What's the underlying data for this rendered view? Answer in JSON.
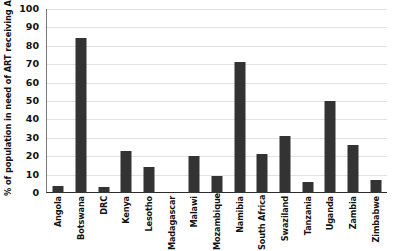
{
  "chart_data": {
    "type": "bar",
    "title": "",
    "xlabel": "",
    "ylabel": "% of population in need of ART receiving ART",
    "ylim": [
      0,
      100
    ],
    "ytick_labels": [
      "100",
      "90",
      "80",
      "70",
      "60",
      "50",
      "40",
      "30",
      "20",
      "10",
      "0"
    ],
    "yticks": [
      100,
      90,
      80,
      70,
      60,
      50,
      40,
      30,
      20,
      10,
      0
    ],
    "grid": true,
    "legend": false,
    "bar_color": "#333333",
    "categories": [
      "Angola",
      "Botswana",
      "DRC",
      "Kenya",
      "Lesotho",
      "Madagascar",
      "Malawi",
      "Mozambique",
      "Namibia",
      "South Africa",
      "Swaziland",
      "Tanzania",
      "Uganda",
      "Zambia",
      "Zimbabwe"
    ],
    "values": [
      4,
      84,
      3,
      23,
      14,
      0,
      20,
      9,
      71,
      21,
      31,
      6,
      50,
      26,
      7
    ]
  }
}
